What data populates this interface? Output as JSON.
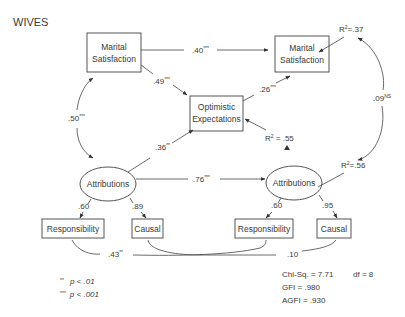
{
  "title": "WIVES",
  "nodes": {
    "ms_left": {
      "line1": "Marital",
      "line2": "Satisfaction"
    },
    "ms_right": {
      "line1": "Marital",
      "line2": "Satisfaction"
    },
    "optimistic": {
      "line1": "Optimistic",
      "line2": "Expectations"
    },
    "attr_left": {
      "label": "Attributions"
    },
    "attr_right": {
      "label": "Attributions"
    },
    "resp_left": {
      "label": "Responsibility"
    },
    "causal_left": {
      "label": "Causal"
    },
    "resp_right": {
      "label": "Responsibility"
    },
    "causal_right": {
      "label": "Causal"
    }
  },
  "paths": {
    "ms_to_ms": {
      "value": ".40",
      "sig": "***"
    },
    "ms_to_opt": {
      "value": ".49",
      "sig": "***"
    },
    "opt_to_ms": {
      "value": ".26",
      "sig": "***"
    },
    "ms_attr_cov": {
      "value": ".50",
      "sig": "***"
    },
    "attr_to_opt": {
      "value": ".36",
      "sig": "**"
    },
    "attr_to_attr": {
      "value": ".76",
      "sig": "***"
    },
    "r2_cov": {
      "value": ".09",
      "sig": "NS"
    },
    "resp_cov": {
      "value": ".43",
      "sig": "**"
    },
    "causal_cov": {
      "value": ".10",
      "sig": ""
    }
  },
  "loadings": {
    "left_resp": ".60",
    "left_causal": ".89",
    "right_resp": ".60",
    "right_causal": ".95"
  },
  "r_squared": {
    "ms_right": {
      "prefix": "R",
      "exp": "2",
      "value": "=.37"
    },
    "optimistic": {
      "prefix": "R",
      "exp": "2",
      "value": " = .55"
    },
    "attr_right": {
      "prefix": "R",
      "exp": "2",
      "value": "=.56"
    }
  },
  "legend": {
    "p01": {
      "stars": "**",
      "text": "p < .01"
    },
    "p001": {
      "stars": "***",
      "text": "p < .001"
    }
  },
  "fit": {
    "chisq": "Chi-Sq. = 7.71",
    "df": "df = 8",
    "gfi": "GFI = .980",
    "agfi": "AGFI = .930"
  }
}
